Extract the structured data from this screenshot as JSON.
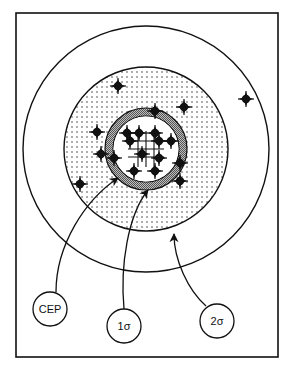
{
  "diagram": {
    "type": "target-dispersion",
    "colors": {
      "ink": "#111111",
      "background": "#ffffff",
      "stipple": "#333333",
      "ring_hatch": "#777777"
    },
    "frame": {
      "x": 16,
      "y": 13,
      "width": 262,
      "height": 344
    },
    "center": {
      "x": 146,
      "y": 149
    },
    "circles": {
      "two_sigma": {
        "r": 123
      },
      "one_sigma": {
        "r": 82
      },
      "cep_outer": {
        "r": 41
      },
      "cep_inner": {
        "r": 33
      }
    },
    "labels": [
      {
        "id": "cep",
        "text": "CEP",
        "cx": 50,
        "cy": 309,
        "r": 17
      },
      {
        "id": "one_sigma",
        "text": "1σ",
        "cx": 124,
        "cy": 326,
        "r": 17
      },
      {
        "id": "two_sigma",
        "text": "2σ",
        "cx": 217,
        "cy": 321,
        "r": 17
      }
    ],
    "shots": [
      {
        "x": 118,
        "y": 86
      },
      {
        "x": 184,
        "y": 107
      },
      {
        "x": 246,
        "y": 99
      },
      {
        "x": 155,
        "y": 111
      },
      {
        "x": 97,
        "y": 132
      },
      {
        "x": 101,
        "y": 154
      },
      {
        "x": 127,
        "y": 133
      },
      {
        "x": 130,
        "y": 141
      },
      {
        "x": 139,
        "y": 133
      },
      {
        "x": 155,
        "y": 133
      },
      {
        "x": 159,
        "y": 141
      },
      {
        "x": 171,
        "y": 141
      },
      {
        "x": 142,
        "y": 154
      },
      {
        "x": 114,
        "y": 158
      },
      {
        "x": 159,
        "y": 158
      },
      {
        "x": 180,
        "y": 163
      },
      {
        "x": 134,
        "y": 171
      },
      {
        "x": 155,
        "y": 171
      },
      {
        "x": 80,
        "y": 184
      },
      {
        "x": 180,
        "y": 181
      }
    ]
  }
}
